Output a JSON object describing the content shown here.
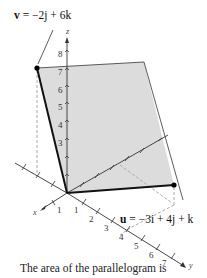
{
  "figure": {
    "vector_v": {
      "name": "v",
      "expression": "= −2j + 6k",
      "label_text": "v = −2j + 6k",
      "components": {
        "i": 0,
        "j": -2,
        "k": 6
      }
    },
    "vector_u": {
      "name": "u",
      "expression": "= −3i + 4j + k",
      "label_text": "u = −3i + 4j + k",
      "components": {
        "i": -3,
        "j": 4,
        "k": 1
      }
    },
    "axes": {
      "x": {
        "label": "x",
        "ticks": [
          "1"
        ]
      },
      "y": {
        "label": "y",
        "ticks": [
          "1",
          "2",
          "3",
          "4",
          "5",
          "6",
          "7"
        ]
      },
      "z": {
        "label": "z",
        "ticks": [
          "3",
          "4",
          "5",
          "6",
          "7",
          "8"
        ]
      }
    },
    "shape": "parallelogram",
    "fill_color": "#dcdcdc",
    "edge_color": "#111111"
  },
  "caption": "The area of the parallelogram is"
}
